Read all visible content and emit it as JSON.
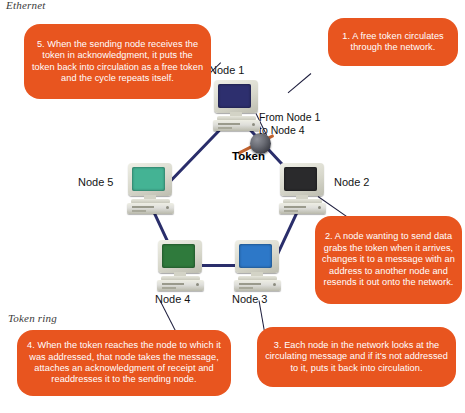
{
  "figure": {
    "section_top_label": "Ethernet",
    "section_bottom_label": "Token ring"
  },
  "center": {
    "token_label": "Token",
    "transfer_line1": "From Node 1",
    "transfer_line2": "to Node 4"
  },
  "nodes": [
    {
      "label": "Node 1",
      "screen_color": "#2d2f6e"
    },
    {
      "label": "Node 2",
      "screen_color": "#2a2a2c"
    },
    {
      "label": "Node 3",
      "screen_color": "#2d78c8"
    },
    {
      "label": "Node 4",
      "screen_color": "#2f7a3c"
    },
    {
      "label": "Node 5",
      "screen_color": "#44b394"
    }
  ],
  "callouts": [
    {
      "id": "callout-1",
      "text": "1. A free token circulates through the network."
    },
    {
      "id": "callout-2",
      "text": "2. A node wanting to send data grabs the token when it arrives, changes it to a message with an address to another node and resends it out onto the network."
    },
    {
      "id": "callout-3",
      "text": "3. Each node in the network looks at the circulating message and if it's not addressed to it, puts it back into circulation."
    },
    {
      "id": "callout-4",
      "text": "4. When the token reaches the node to which it was addressed, that node takes the message, attaches an acknowledgment of receipt and readdresses it to the sending node."
    },
    {
      "id": "callout-5",
      "text": "5. When the sending node receives the token in acknowledgment, it puts the token back into circulation as a free token and the cycle repeats itself."
    }
  ],
  "colors": {
    "callout_orange": "#e8551f",
    "link_navy": "#2a2e6b",
    "token_bar": "#c0612d"
  }
}
